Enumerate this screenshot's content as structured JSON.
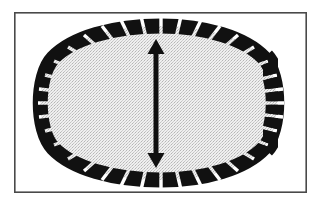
{
  "figure": {
    "title": "Segmented oval outline with vertical double-headed measurement arrow",
    "caption": "",
    "width": 323,
    "height": 205,
    "background_color": "#ffffff"
  },
  "frame": {
    "name": "figure-border",
    "x": 14,
    "y": 12,
    "width": 293,
    "height": 181,
    "stroke_color": "#4a4a4a",
    "stroke_width": 1.6,
    "fill": "none"
  },
  "oval": {
    "name": "segmented-oval-outline",
    "description": "Egg-shaped closed outline drawn as discrete black segments",
    "center_x": 161,
    "center_y": 103,
    "radius_x": 120,
    "radius_y": 77,
    "segment_color": "#111111",
    "gap_color": "#ffffff",
    "segment_count": 44
  },
  "interior": {
    "name": "stippled-interior-fill",
    "description": "Fine crosshatch stipple halftone texture",
    "fill_color": "#ededed",
    "dot_color": "#b9b9b9",
    "pattern": "crosshatch-stipple",
    "pattern_pitch": 3
  },
  "arrow": {
    "name": "vertical-double-headed-arrow",
    "description": "Double-headed arrow marking the vertical (short) axis of the oval",
    "color": "#101010",
    "x": 156,
    "y_top": 39,
    "y_bottom": 168,
    "length": 129,
    "shaft_width": 5,
    "head_width": 17,
    "head_length": 15,
    "heads": "both",
    "orientation": "vertical",
    "label": ""
  },
  "chart_data": {
    "type": "diagram",
    "title": "Segmented oval outline with vertical double-headed measurement arrow",
    "elements": [
      {
        "name": "segmented-oval-outline",
        "kind": "closed-dashed-ellipse",
        "center": [
          161,
          103
        ],
        "radii": [
          120,
          77
        ],
        "segments": 44,
        "color": "#111111"
      },
      {
        "name": "stippled-interior-fill",
        "kind": "texture-fill",
        "color": "#ededed"
      },
      {
        "name": "vertical-double-headed-arrow",
        "kind": "measurement-arrow",
        "from": [
          156,
          39
        ],
        "to": [
          156,
          168
        ],
        "length": 129,
        "color": "#101010"
      },
      {
        "name": "figure-border",
        "kind": "rectangle",
        "origin": [
          14,
          12
        ],
        "size": [
          293,
          181
        ],
        "color": "#4a4a4a"
      }
    ],
    "annotations": [],
    "legend": [],
    "xlabel": "",
    "ylabel": ""
  }
}
